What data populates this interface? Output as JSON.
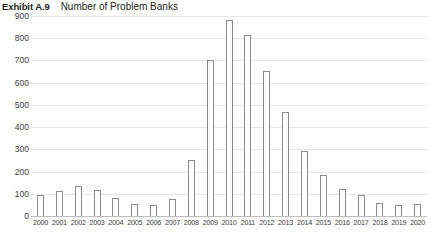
{
  "header": {
    "exhibit_label": "Exhibit A.9",
    "title": "Number of Problem Banks"
  },
  "chart_data": {
    "type": "bar",
    "title": "Number of Problem Banks",
    "xlabel": "",
    "ylabel": "",
    "ylim": [
      0,
      900
    ],
    "yticks": [
      900,
      800,
      700,
      600,
      500,
      400,
      300,
      200,
      100,
      0
    ],
    "grid": true,
    "legend": "none",
    "bar_fill": "#ffffff",
    "bar_stroke": "#8c8c8c",
    "categories": [
      "2000",
      "2001",
      "2002",
      "2003",
      "2004",
      "2005",
      "2006",
      "2007",
      "2008",
      "2009",
      "2010",
      "2011",
      "2012",
      "2013",
      "2014",
      "2015",
      "2016",
      "2017",
      "2018",
      "2019",
      "2020"
    ],
    "values": [
      94,
      114,
      136,
      116,
      80,
      52,
      50,
      76,
      252,
      702,
      884,
      813,
      651,
      467,
      291,
      183,
      123,
      95,
      60,
      51,
      56
    ]
  }
}
